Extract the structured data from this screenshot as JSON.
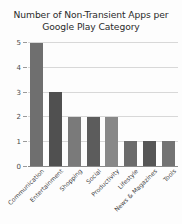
{
  "chart_data": {
    "type": "bar",
    "title": "Number of Non-Transient Apps per Google Play Category",
    "title_line1": "Number of Non-Transient Apps per",
    "title_line2": "Google Play Category",
    "xlabel": "",
    "ylabel": "",
    "ylim": [
      0,
      5
    ],
    "yticks": [
      0,
      1,
      2,
      3,
      4,
      5
    ],
    "grid": true,
    "legend": "none",
    "categories": [
      "Communication",
      "Entertainment",
      "Shopping",
      "Social",
      "Productivity",
      "Lifestyle",
      "News & Magazines",
      "Tools"
    ],
    "values": [
      5,
      3,
      2,
      2,
      2,
      1,
      1,
      1
    ],
    "bar_colors": [
      "#6f6f6f",
      "#505050",
      "#7a7a7a",
      "#5c5c5c",
      "#888888",
      "#6b6b6b",
      "#565656",
      "#737373"
    ]
  },
  "colors": {
    "background": "#fdfdfd",
    "grid": "#d8d8d8",
    "axis": "#8a8a8a",
    "text": "#2b2b2b",
    "tick_text": "#4a4a4a"
  }
}
